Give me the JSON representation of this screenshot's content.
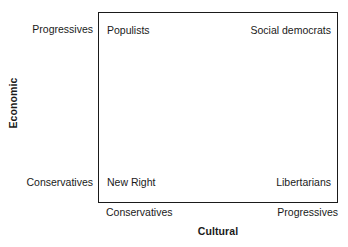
{
  "chart_data": {
    "type": "scatter",
    "title": "",
    "xlabel": "Cultural",
    "ylabel": "Economic",
    "grid": false,
    "legend": "none",
    "x_axis": {
      "title": "Cultural",
      "low_label": "Conservatives",
      "high_label": "Progressives"
    },
    "y_axis": {
      "title": "Economic",
      "low_label": "Conservatives",
      "high_label": "Progressives"
    },
    "quadrants": [
      {
        "id": "top-left",
        "label": "Populists",
        "cultural": "Conservatives",
        "economic": "Progressives"
      },
      {
        "id": "top-right",
        "label": "Social democrats",
        "cultural": "Progressives",
        "economic": "Progressives"
      },
      {
        "id": "bottom-left",
        "label": "New Right",
        "cultural": "Conservatives",
        "economic": "Conservatives"
      },
      {
        "id": "bottom-right",
        "label": "Libertarians",
        "cultural": "Progressives",
        "economic": "Conservatives"
      }
    ]
  },
  "colors": {
    "border": "#1a1a1a",
    "text": "#1a1a1a",
    "background": "#ffffff"
  }
}
